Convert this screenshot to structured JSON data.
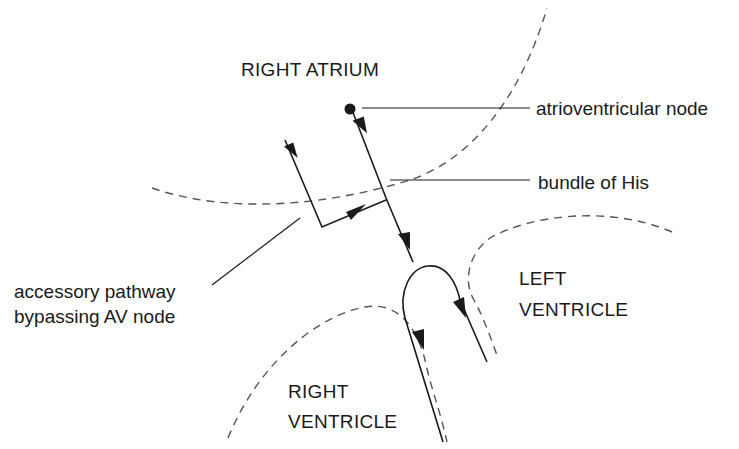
{
  "diagram": {
    "type": "cardiac conduction schematic",
    "regions": {
      "right_atrium": "RIGHT ATRIUM",
      "left_ventricle_line1": "LEFT",
      "left_ventricle_line2": "VENTRICLE",
      "right_ventricle_line1": "RIGHT",
      "right_ventricle_line2": "VENTRICLE"
    },
    "labels": {
      "av_node": "atrioventricular node",
      "bundle_of_his": "bundle of His",
      "accessory_line1": "accessory pathway",
      "accessory_line2": "bypassing AV node"
    },
    "colors": {
      "line": "#1a1a1a",
      "boundary": "#555555",
      "background": "#ffffff"
    }
  }
}
